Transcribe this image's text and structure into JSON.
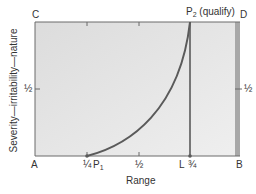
{
  "diagram": {
    "corners": {
      "top_left": "C",
      "top_right": "D",
      "bottom_left": "A",
      "bottom_right": "B"
    },
    "x_axis": {
      "label": "Range",
      "ticks": [
        "¼",
        "½",
        "¾"
      ]
    },
    "y_axis": {
      "label": "Severity—irritability—nature",
      "tick_left": "½",
      "tick_right": "½"
    },
    "points": {
      "p1": {
        "letter": "P",
        "sub": "1"
      },
      "p2": {
        "letter": "P",
        "sub": "2",
        "note": "(qualify)"
      },
      "l": "L"
    },
    "colors": {
      "fill": "#e4e4e4",
      "stroke": "#5a5a5a",
      "band": "#a8a8a8"
    }
  }
}
